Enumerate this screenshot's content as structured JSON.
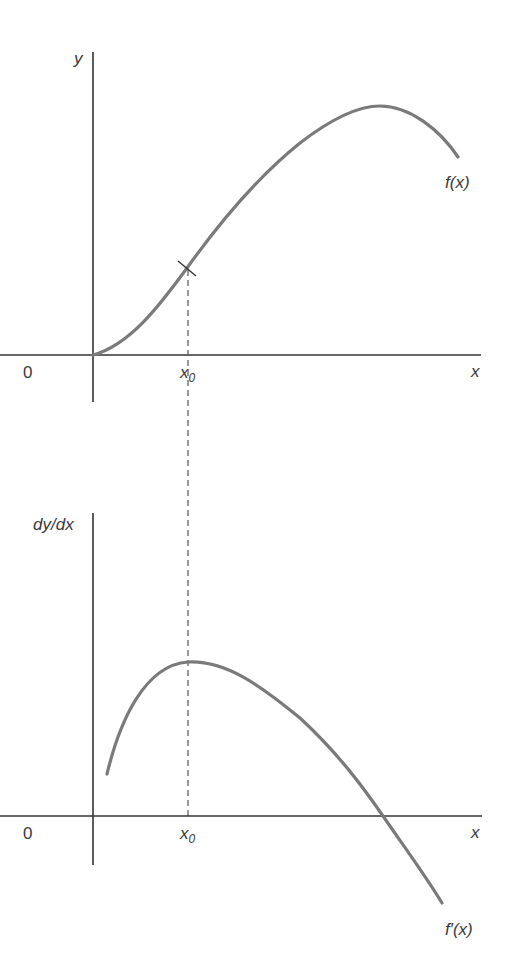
{
  "top_graph": {
    "y_label": "y",
    "x_label": "x",
    "origin_label": "0",
    "x0_label": "x",
    "x0_sub": "0",
    "curve_label": "f(x)"
  },
  "bottom_graph": {
    "y_label": "dy/dx",
    "x_label": "x",
    "origin_label": "0",
    "x0_label": "x",
    "x0_sub": "0",
    "curve_label": "f′(x)"
  },
  "colors": {
    "axis": "#333333",
    "curve": "#7a7a7a",
    "text": "#3a3a3a"
  }
}
